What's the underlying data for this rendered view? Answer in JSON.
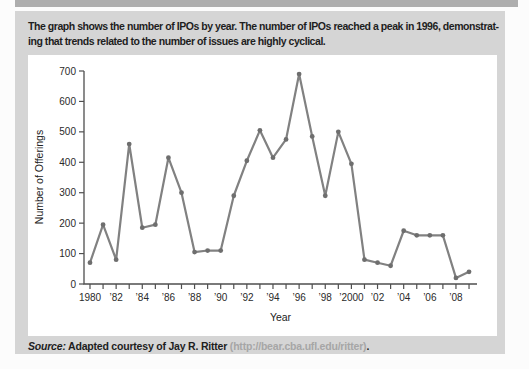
{
  "header": {
    "caption_line1": "The graph shows the number of IPOs by year. The number of IPOs reached a peak in 1996, demonstrat-",
    "caption_line2": "ing that trends related to the number of issues are highly cyclical."
  },
  "source": {
    "label": "Source:",
    "text": " Adapted courtesy of Jay R. Ritter ",
    "url": "(http://bear.cba.ufl.edu/ritter)",
    "suffix": "."
  },
  "colors": {
    "top_strip": "#aeaeae",
    "panel_bg": "#d5d5d5",
    "chart_bg": "#ffffff",
    "axis": "#4f4f4f",
    "line": "#818181",
    "marker": "#6e6e6e",
    "url_text": "#a6a6a6"
  },
  "chart_data": {
    "type": "line",
    "title": "",
    "xlabel": "Year",
    "ylabel": "Number of Offerings",
    "ylim": [
      0,
      700
    ],
    "ytick_step": 100,
    "grid": false,
    "legend": "none",
    "x": [
      1980,
      1981,
      1982,
      1983,
      1984,
      1985,
      1986,
      1987,
      1988,
      1989,
      1990,
      1991,
      1992,
      1993,
      1994,
      1995,
      1996,
      1997,
      1998,
      1999,
      2000,
      2001,
      2002,
      2003,
      2004,
      2005,
      2006,
      2007,
      2008,
      2009
    ],
    "values": [
      70,
      195,
      80,
      460,
      185,
      195,
      415,
      300,
      105,
      110,
      110,
      290,
      405,
      505,
      415,
      475,
      690,
      485,
      290,
      500,
      395,
      80,
      70,
      60,
      175,
      160,
      160,
      160,
      20,
      40
    ],
    "xtick_labels": [
      "1980",
      "’82",
      "’84",
      "’86",
      "’88",
      "’90",
      "’92",
      "’94",
      "’96",
      "’98",
      "’2000",
      "’02",
      "’04",
      "’06",
      "’08"
    ],
    "xtick_label_every": 2
  }
}
